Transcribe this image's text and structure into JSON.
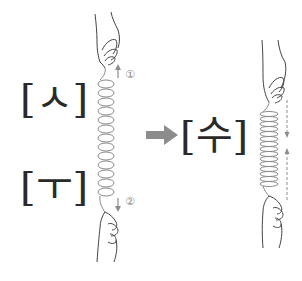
{
  "diagram": {
    "left": {
      "top_label": "[ㅅ]",
      "bottom_label": "[ㅜ]",
      "spring": {
        "state": "stretched",
        "coils": 16
      },
      "top_marker": "①",
      "bottom_marker": "②",
      "top_arrow": "up-arrow",
      "bottom_arrow": "down-arrow"
    },
    "transition_arrow": "right-arrow",
    "right": {
      "label": "[수]",
      "spring": {
        "state": "compressed",
        "coils": 18
      },
      "arrows": [
        "dashed-down-arrow",
        "dashed-up-arrow"
      ]
    },
    "colors": {
      "line": "#555555",
      "spring": "#8a8a8a",
      "arrow": "#8c8c8c",
      "text": "#2a2a2a"
    }
  }
}
